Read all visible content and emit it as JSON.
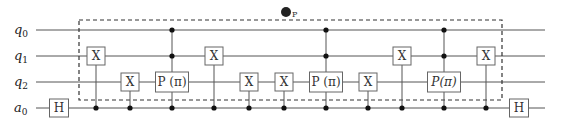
{
  "circuit": {
    "qubits": [
      {
        "name": "q",
        "sub": "0",
        "y": 30
      },
      {
        "name": "q",
        "sub": "1",
        "y": 56
      },
      {
        "name": "q",
        "sub": "2",
        "y": 82
      },
      {
        "name": "a",
        "sub": "0",
        "y": 108
      }
    ],
    "wire_start_x": 36,
    "wire_end_x": 545,
    "barrier_box": {
      "x": 79,
      "y": 20,
      "width": 423,
      "height": 80
    },
    "barrier_marker": {
      "label": "P",
      "x": 286,
      "y": 12
    },
    "gates": [
      {
        "type": "box",
        "label": "H",
        "x": 59,
        "qubit": 3,
        "width": 19
      },
      {
        "type": "cx",
        "label": "X",
        "x": 96,
        "target": 1,
        "controls": [
          3
        ]
      },
      {
        "type": "cx",
        "label": "X",
        "x": 130,
        "target": 2,
        "controls": [
          3
        ]
      },
      {
        "type": "cp",
        "label": "P (π)",
        "x": 172,
        "target": 2,
        "controls": [
          0,
          1,
          3
        ],
        "width": 33
      },
      {
        "type": "cx",
        "label": "X",
        "x": 214,
        "target": 1,
        "controls": [
          3
        ]
      },
      {
        "type": "cx",
        "label": "X",
        "x": 249,
        "target": 2,
        "controls": [
          3
        ]
      },
      {
        "type": "cx",
        "label": "X",
        "x": 284,
        "target": 2,
        "controls": [
          3
        ]
      },
      {
        "type": "cp",
        "label": "P (π)",
        "x": 326,
        "target": 2,
        "controls": [
          0,
          1,
          3
        ],
        "width": 33
      },
      {
        "type": "cx",
        "label": "X",
        "x": 368,
        "target": 2,
        "controls": [
          3
        ]
      },
      {
        "type": "cx",
        "label": "X",
        "x": 402,
        "target": 1,
        "controls": [
          3
        ]
      },
      {
        "type": "cp",
        "label": "P(π)",
        "italic": true,
        "x": 444,
        "target": 2,
        "controls": [
          0,
          1,
          3
        ],
        "width": 33
      },
      {
        "type": "cx",
        "label": "X",
        "x": 486,
        "target": 1,
        "controls": [
          3
        ]
      },
      {
        "type": "box",
        "label": "H",
        "x": 519,
        "qubit": 3,
        "width": 19
      }
    ],
    "colors": {
      "wire": "#555555",
      "box_stroke": "#666666",
      "box_fill": "#ffffff",
      "dot": "#111111",
      "barrier": "#333333"
    }
  }
}
